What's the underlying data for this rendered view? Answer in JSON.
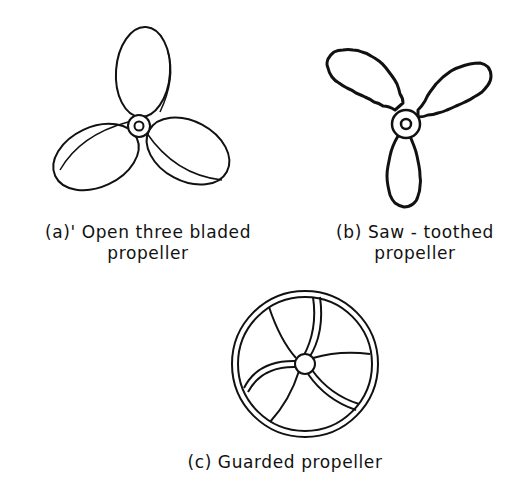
{
  "figures": {
    "a": {
      "id": "(a)",
      "title": "Open three bladed",
      "subtitle": "propeller",
      "line1": "(a)' Open three bladed",
      "line2": "propeller"
    },
    "b": {
      "id": "(b)",
      "title": "Saw-toothed",
      "subtitle": "propeller",
      "line1": "(b) Saw - toothed",
      "line2": "propeller"
    },
    "c": {
      "id": "(c)",
      "title": "Guarded propeller",
      "line1": "(c) Guarded propeller"
    }
  },
  "colors": {
    "stroke": "#111111",
    "background": "#ffffff"
  }
}
